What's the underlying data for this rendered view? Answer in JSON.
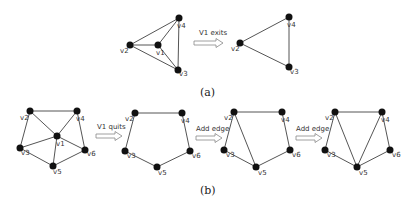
{
  "figure": {
    "part_a": {
      "caption": "(a)",
      "arrow_label": "V1 exits",
      "before": {
        "nodes": [
          {
            "id": "v4",
            "label": "v4",
            "x": 179,
            "y": 18,
            "lx": 177,
            "ly": 28
          },
          {
            "id": "v2",
            "label": "v2",
            "x": 130,
            "y": 45,
            "lx": 120,
            "ly": 53
          },
          {
            "id": "v1",
            "label": "v1",
            "x": 158,
            "y": 45,
            "lx": 156,
            "ly": 55
          },
          {
            "id": "v3",
            "label": "v3",
            "x": 178,
            "y": 70,
            "lx": 179,
            "ly": 76
          }
        ],
        "edges": [
          [
            "v2",
            "v4"
          ],
          [
            "v2",
            "v1"
          ],
          [
            "v2",
            "v3"
          ],
          [
            "v1",
            "v4"
          ],
          [
            "v1",
            "v3"
          ],
          [
            "v4",
            "v3"
          ]
        ]
      },
      "after": {
        "nodes": [
          {
            "id": "v4",
            "label": "v4",
            "x": 289,
            "y": 17,
            "lx": 287,
            "ly": 27
          },
          {
            "id": "v2",
            "label": "v2",
            "x": 240,
            "y": 43,
            "lx": 231,
            "ly": 51
          },
          {
            "id": "v3",
            "label": "v3",
            "x": 289,
            "y": 67,
            "lx": 290,
            "ly": 74
          }
        ],
        "edges": [
          [
            "v2",
            "v4"
          ],
          [
            "v2",
            "v3"
          ],
          [
            "v4",
            "v3"
          ]
        ]
      }
    },
    "part_b": {
      "caption": "(b)",
      "arrow_labels": [
        "V1 quits",
        "Add edge",
        "Add edge"
      ],
      "graphs": [
        {
          "nodes": [
            {
              "id": "v2",
              "label": "v2",
              "x": 30,
              "y": 111,
              "lx": 20,
              "ly": 120
            },
            {
              "id": "v4",
              "label": "v4",
              "x": 77,
              "y": 111,
              "lx": 76,
              "ly": 121
            },
            {
              "id": "v1",
              "label": "v1",
              "x": 57,
              "y": 136,
              "lx": 56,
              "ly": 146
            },
            {
              "id": "v3",
              "label": "v3",
              "x": 20,
              "y": 148,
              "lx": 21,
              "ly": 155
            },
            {
              "id": "v6",
              "label": "v6",
              "x": 85,
              "y": 150,
              "lx": 87,
              "ly": 156
            },
            {
              "id": "v5",
              "label": "v5",
              "x": 53,
              "y": 166,
              "lx": 53,
              "ly": 174
            }
          ],
          "edges": [
            [
              "v2",
              "v4"
            ],
            [
              "v2",
              "v3"
            ],
            [
              "v2",
              "v1"
            ],
            [
              "v4",
              "v1"
            ],
            [
              "v4",
              "v6"
            ],
            [
              "v1",
              "v3"
            ],
            [
              "v1",
              "v5"
            ],
            [
              "v1",
              "v6"
            ],
            [
              "v3",
              "v5"
            ],
            [
              "v5",
              "v6"
            ]
          ]
        },
        {
          "nodes": [
            {
              "id": "v2",
              "label": "v2",
              "x": 135,
              "y": 113,
              "lx": 125,
              "ly": 121
            },
            {
              "id": "v4",
              "label": "v4",
              "x": 182,
              "y": 113,
              "lx": 181,
              "ly": 123
            },
            {
              "id": "v3",
              "label": "v3",
              "x": 125,
              "y": 151,
              "lx": 127,
              "ly": 158
            },
            {
              "id": "v6",
              "label": "v6",
              "x": 190,
              "y": 151,
              "lx": 192,
              "ly": 158
            },
            {
              "id": "v5",
              "label": "v5",
              "x": 157,
              "y": 167,
              "lx": 158,
              "ly": 175
            }
          ],
          "edges": [
            [
              "v2",
              "v4"
            ],
            [
              "v4",
              "v6"
            ],
            [
              "v6",
              "v5"
            ],
            [
              "v5",
              "v3"
            ],
            [
              "v3",
              "v2"
            ]
          ]
        },
        {
          "nodes": [
            {
              "id": "v2",
              "label": "v2",
              "x": 234,
              "y": 112,
              "lx": 224,
              "ly": 120
            },
            {
              "id": "v4",
              "label": "v4",
              "x": 282,
              "y": 112,
              "lx": 281,
              "ly": 122
            },
            {
              "id": "v3",
              "label": "v3",
              "x": 224,
              "y": 150,
              "lx": 226,
              "ly": 157
            },
            {
              "id": "v6",
              "label": "v6",
              "x": 290,
              "y": 150,
              "lx": 292,
              "ly": 157
            },
            {
              "id": "v5",
              "label": "v5",
              "x": 256,
              "y": 167,
              "lx": 258,
              "ly": 175
            }
          ],
          "edges": [
            [
              "v2",
              "v4"
            ],
            [
              "v4",
              "v6"
            ],
            [
              "v6",
              "v5"
            ],
            [
              "v5",
              "v3"
            ],
            [
              "v3",
              "v2"
            ],
            [
              "v2",
              "v5"
            ]
          ]
        },
        {
          "nodes": [
            {
              "id": "v2",
              "label": "v2",
              "x": 335,
              "y": 112,
              "lx": 325,
              "ly": 120
            },
            {
              "id": "v4",
              "label": "v4",
              "x": 382,
              "y": 112,
              "lx": 381,
              "ly": 122
            },
            {
              "id": "v3",
              "label": "v3",
              "x": 325,
              "y": 150,
              "lx": 327,
              "ly": 157
            },
            {
              "id": "v6",
              "label": "v6",
              "x": 390,
              "y": 150,
              "lx": 392,
              "ly": 157
            },
            {
              "id": "v5",
              "label": "v5",
              "x": 357,
              "y": 167,
              "lx": 359,
              "ly": 175
            }
          ],
          "edges": [
            [
              "v2",
              "v4"
            ],
            [
              "v4",
              "v6"
            ],
            [
              "v6",
              "v5"
            ],
            [
              "v5",
              "v3"
            ],
            [
              "v3",
              "v2"
            ],
            [
              "v2",
              "v5"
            ],
            [
              "v4",
              "v5"
            ]
          ]
        }
      ]
    }
  }
}
